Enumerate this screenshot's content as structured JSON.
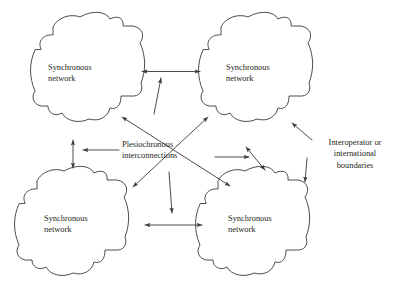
{
  "figure": {
    "type": "diagram",
    "background_color": "#ffffff",
    "stroke_color": "#3a3a3a",
    "text_color": "#231f20"
  },
  "nodes": [
    {
      "id": "top-left",
      "line1": "Synchronous",
      "line2": "network"
    },
    {
      "id": "top-right",
      "line1": "Synchronous",
      "line2": "network"
    },
    {
      "id": "bottom-left",
      "line1": "Synchronous",
      "line2": "network"
    },
    {
      "id": "bottom-right",
      "line1": "Synchronous",
      "line2": "network"
    }
  ],
  "annotations": {
    "center": {
      "line1": "Plesiochronous",
      "line2": "interconnections"
    },
    "right": {
      "line1": "Interoperator or",
      "line2": "international",
      "line3": "boundaries"
    }
  },
  "connections": [
    {
      "id": "top-horizontal",
      "kind": "double-arrow"
    },
    {
      "id": "bottom-horizontal",
      "kind": "double-arrow"
    },
    {
      "id": "left-vertical",
      "kind": "double-arrow"
    },
    {
      "id": "right-vertical",
      "kind": "double-arrow"
    },
    {
      "id": "diagonal-tl-br",
      "kind": "double-arrow"
    },
    {
      "id": "diagonal-tr-bl",
      "kind": "double-arrow"
    }
  ],
  "pointers": [
    {
      "id": "pointer-to-top-horizontal",
      "kind": "single-arrow"
    },
    {
      "id": "pointer-to-left-vertical",
      "kind": "single-arrow"
    },
    {
      "id": "pointer-to-right-vertical",
      "kind": "single-arrow"
    },
    {
      "id": "pointer-to-bottom-horizontal",
      "kind": "single-arrow"
    },
    {
      "id": "pointer-boundary-upper",
      "kind": "single-arrow"
    },
    {
      "id": "pointer-boundary-lower",
      "kind": "single-arrow"
    }
  ]
}
